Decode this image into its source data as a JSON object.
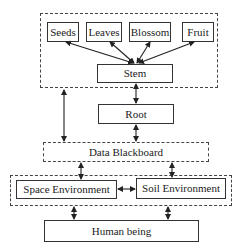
{
  "diagram": {
    "plant_group": {
      "parts": [
        {
          "label": "Seeds"
        },
        {
          "label": "Leaves"
        },
        {
          "label": "Blossom"
        },
        {
          "label": "Fruit"
        }
      ],
      "stem": {
        "label": "Stem"
      }
    },
    "root": {
      "label": "Root"
    },
    "blackboard": {
      "label": "Data Blackboard"
    },
    "environment_group": {
      "space": {
        "label": "Space Environment"
      },
      "soil": {
        "label": "Soil Environment"
      }
    },
    "human": {
      "label": "Human being"
    },
    "edges": [
      {
        "from": "Seeds",
        "to": "Stem",
        "type": "bidirectional"
      },
      {
        "from": "Leaves",
        "to": "Stem",
        "type": "bidirectional"
      },
      {
        "from": "Blossom",
        "to": "Stem",
        "type": "bidirectional"
      },
      {
        "from": "Fruit",
        "to": "Stem",
        "type": "bidirectional"
      },
      {
        "from": "Stem",
        "to": "Root",
        "type": "bidirectional"
      },
      {
        "from": "Plant group",
        "to": "Data Blackboard",
        "type": "bidirectional"
      },
      {
        "from": "Root",
        "to": "Data Blackboard",
        "type": "bidirectional"
      },
      {
        "from": "Data Blackboard",
        "to": "Space Environment",
        "type": "bidirectional"
      },
      {
        "from": "Data Blackboard",
        "to": "Soil Environment",
        "type": "bidirectional"
      },
      {
        "from": "Space Environment",
        "to": "Soil Environment",
        "type": "bidirectional"
      },
      {
        "from": "Environment group",
        "to": "Human being",
        "type": "bidirectional"
      }
    ]
  }
}
